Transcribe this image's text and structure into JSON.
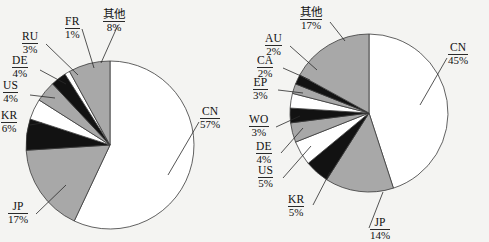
{
  "figure": {
    "background": "#f4f4f2",
    "palette": {
      "gray": "#a8a8a8",
      "black": "#121212",
      "white": "#ffffff",
      "stroke": "#3a3a3a",
      "leader": "#2a2a2a"
    }
  },
  "chart_data": [
    {
      "type": "pie",
      "title": "",
      "id": "left-pie",
      "start_angle_deg": 0,
      "direction": "clockwise",
      "categories": [
        "CN",
        "JP",
        "KR",
        "US",
        "DE",
        "RU",
        "FR",
        "其他"
      ],
      "values": [
        57,
        17,
        6,
        4,
        4,
        3,
        1,
        8
      ],
      "labels": [
        "CN 57%",
        "JP 17%",
        "KR 6%",
        "US 4%",
        "DE 4%",
        "RU 3%",
        "FR 1%",
        "其他 8%"
      ],
      "value_suffix": "%",
      "fills": [
        "white",
        "gray",
        "black",
        "white",
        "gray",
        "black",
        "white",
        "gray"
      ],
      "legend": "none",
      "grid": false
    },
    {
      "type": "pie",
      "title": "",
      "id": "right-pie",
      "start_angle_deg": 0,
      "direction": "clockwise",
      "categories": [
        "CN",
        "JP",
        "KR",
        "US",
        "DE",
        "WO",
        "EP",
        "CA",
        "AU",
        "其他"
      ],
      "values": [
        45,
        14,
        5,
        5,
        4,
        3,
        3,
        2,
        2,
        17
      ],
      "labels": [
        "CN 45%",
        "JP 14%",
        "KR 5%",
        "US 5%",
        "DE 4%",
        "WO 3%",
        "EP 3%",
        "CA 2%",
        "AU 2%",
        "其他 17%"
      ],
      "value_suffix": "%",
      "fills": [
        "white",
        "gray",
        "black",
        "white",
        "gray",
        "black",
        "white",
        "gray",
        "black",
        "gray"
      ],
      "legend": "none",
      "grid": false
    }
  ],
  "left_chart": {
    "labels": [
      {
        "code": "RU",
        "pct": "3%"
      },
      {
        "code": "FR",
        "pct": "1%"
      },
      {
        "code": "其他",
        "pct": "8%"
      },
      {
        "code": "DE",
        "pct": "4%"
      },
      {
        "code": "US",
        "pct": "4%"
      },
      {
        "code": "KR",
        "pct": "6%"
      },
      {
        "code": "CN",
        "pct": "57%"
      },
      {
        "code": "JP",
        "pct": "17%"
      }
    ]
  },
  "right_chart": {
    "labels": [
      {
        "code": "其他",
        "pct": "17%"
      },
      {
        "code": "AU",
        "pct": "2%"
      },
      {
        "code": "CA",
        "pct": "2%"
      },
      {
        "code": "EP",
        "pct": "3%"
      },
      {
        "code": "WO",
        "pct": "3%"
      },
      {
        "code": "DE",
        "pct": "4%"
      },
      {
        "code": "US",
        "pct": "5%"
      },
      {
        "code": "KR",
        "pct": "5%"
      },
      {
        "code": "CN",
        "pct": "45%"
      },
      {
        "code": "JP",
        "pct": "14%"
      }
    ]
  }
}
